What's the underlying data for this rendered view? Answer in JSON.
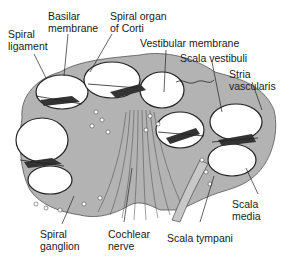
{
  "diagram": {
    "colors": {
      "bone": "#b3b3b3",
      "outline": "#222222",
      "duct_fill": "#ffffff",
      "organ": "#333333",
      "background": "#ffffff"
    },
    "labels": {
      "spiral_ligament": "Spiral\nligament",
      "basilar_membrane": "Basilar\nmembrane",
      "spiral_organ_corti": "Spiral organ\nof Corti",
      "vestibular_membrane": "Vestibular membrane",
      "scala_vestibuli": "Scala vestibuli",
      "stria_vascularis": "Stria\nvascularis",
      "scala_media": "Scala\nmedia",
      "spiral_ganglion": "Spiral\nganglion",
      "cochlear_nerve": "Cochlear\nnerve",
      "scala_tympani": "Scala tympani"
    }
  }
}
